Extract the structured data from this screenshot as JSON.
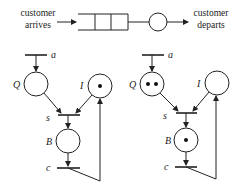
{
  "queue": {
    "arrives_line1": "customer",
    "arrives_line2": "arrives",
    "departs_line1": "customer",
    "departs_line2": "departs",
    "buffer_slots": 3
  },
  "nets": [
    {
      "id": "left",
      "labels": {
        "a": "a",
        "Q": "Q",
        "I": "I",
        "s": "s",
        "B": "B",
        "c": "c"
      },
      "tokens": {
        "Q": 0,
        "I": 1,
        "B": 0
      }
    },
    {
      "id": "right",
      "labels": {
        "a": "a",
        "Q": "Q",
        "I": "I",
        "s": "s",
        "B": "B",
        "c": "c"
      },
      "tokens": {
        "Q": 2,
        "I": 0,
        "B": 1
      }
    }
  ],
  "colors": {
    "stroke": "#222222",
    "background": "#ffffff"
  }
}
